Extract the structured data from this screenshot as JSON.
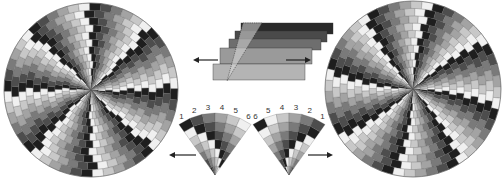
{
  "diagram": {
    "strip_stack": {
      "strips": 5,
      "colors": [
        "#2a2a2a",
        "#4a4a4a",
        "#6e6e6e",
        "#9a9a9a",
        "#b4b4b4"
      ]
    },
    "left_wedge": {
      "labels": [
        "1",
        "2",
        "3",
        "4",
        "5",
        "6"
      ]
    },
    "right_wedge": {
      "labels": [
        "6",
        "5",
        "4",
        "3",
        "2",
        "1"
      ]
    },
    "arrows": {
      "top_left": "arrow-left",
      "top_right": "arrow-right",
      "bottom_left": "arrow-left",
      "bottom_right": "arrow-right"
    },
    "palette": [
      "#1e1e1e",
      "#4d4d4d",
      "#7a7a7a",
      "#a3a3a3",
      "#c8c8c8",
      "#f0f0f0"
    ]
  }
}
